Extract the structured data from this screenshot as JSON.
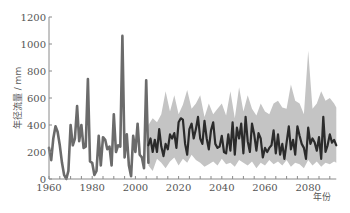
{
  "chart_data": {
    "type": "line",
    "title": "",
    "xlabel": "年份",
    "ylabel": "年径流量 / mm",
    "xlim": [
      1960,
      2093
    ],
    "ylim": [
      0,
      1200
    ],
    "x_ticks": [
      1960,
      1980,
      2000,
      2020,
      2040,
      2060,
      2080
    ],
    "y_ticks": [
      0,
      200,
      400,
      600,
      800,
      1000,
      1200
    ],
    "grid": false,
    "legend": null,
    "colors": {
      "observed": "#6b6b6b",
      "projected": "#2b2b2b",
      "band": "#c4c4c4",
      "axis": "#8a8a8a"
    },
    "series": [
      {
        "name": "observed",
        "x": [
          1960,
          1961,
          1962,
          1963,
          1964,
          1965,
          1966,
          1967,
          1968,
          1969,
          1970,
          1971,
          1972,
          1973,
          1974,
          1975,
          1976,
          1977,
          1978,
          1979,
          1980,
          1981,
          1982,
          1983,
          1984,
          1985,
          1986,
          1987,
          1988,
          1989,
          1990,
          1991,
          1992,
          1993,
          1994,
          1995,
          1996,
          1997,
          1998,
          1999,
          2000,
          2001,
          2002,
          2003,
          2004,
          2005,
          2006
        ],
        "values": [
          230,
          140,
          300,
          390,
          350,
          250,
          120,
          30,
          0,
          60,
          400,
          250,
          300,
          540,
          280,
          400,
          230,
          240,
          740,
          130,
          120,
          30,
          60,
          320,
          100,
          310,
          290,
          220,
          240,
          100,
          480,
          200,
          250,
          240,
          1060,
          160,
          330,
          100,
          20,
          320,
          200,
          410,
          180,
          160,
          80,
          730,
          120
        ]
      },
      {
        "name": "projected_mean",
        "x": [
          2006,
          2007,
          2008,
          2009,
          2010,
          2011,
          2012,
          2013,
          2014,
          2015,
          2016,
          2017,
          2018,
          2019,
          2020,
          2021,
          2022,
          2023,
          2024,
          2025,
          2026,
          2027,
          2028,
          2029,
          2030,
          2031,
          2032,
          2033,
          2034,
          2035,
          2036,
          2037,
          2038,
          2039,
          2040,
          2041,
          2042,
          2043,
          2044,
          2045,
          2046,
          2047,
          2048,
          2049,
          2050,
          2051,
          2052,
          2053,
          2054,
          2055,
          2056,
          2057,
          2058,
          2059,
          2060,
          2061,
          2062,
          2063,
          2064,
          2065,
          2066,
          2067,
          2068,
          2069,
          2070,
          2071,
          2072,
          2073,
          2074,
          2075,
          2076,
          2077,
          2078,
          2079,
          2080,
          2081,
          2082,
          2083,
          2084,
          2085,
          2086,
          2087,
          2088,
          2089,
          2090,
          2091,
          2092,
          2093
        ],
        "values": [
          250,
          300,
          200,
          290,
          200,
          370,
          240,
          170,
          260,
          220,
          330,
          300,
          340,
          230,
          420,
          450,
          440,
          260,
          180,
          370,
          410,
          300,
          370,
          460,
          300,
          260,
          430,
          300,
          220,
          360,
          420,
          260,
          230,
          240,
          320,
          200,
          190,
          330,
          210,
          420,
          180,
          380,
          300,
          410,
          190,
          460,
          280,
          200,
          410,
          330,
          210,
          340,
          300,
          160,
          230,
          200,
          230,
          250,
          360,
          190,
          330,
          180,
          260,
          150,
          270,
          390,
          220,
          290,
          180,
          390,
          320,
          260,
          230,
          150,
          380,
          260,
          300,
          270,
          210,
          310,
          150,
          460,
          200,
          250,
          330,
          270,
          290,
          250
        ]
      }
    ],
    "band": {
      "name": "projection_range",
      "x": [
        2006,
        2008,
        2010,
        2012,
        2014,
        2016,
        2018,
        2020,
        2022,
        2024,
        2026,
        2028,
        2030,
        2032,
        2034,
        2036,
        2038,
        2040,
        2042,
        2044,
        2046,
        2048,
        2050,
        2052,
        2054,
        2056,
        2058,
        2060,
        2062,
        2064,
        2066,
        2068,
        2070,
        2072,
        2074,
        2076,
        2078,
        2080,
        2082,
        2084,
        2086,
        2088,
        2090,
        2092,
        2093
      ],
      "upper": [
        400,
        450,
        420,
        480,
        650,
        500,
        620,
        480,
        550,
        660,
        520,
        560,
        620,
        460,
        560,
        480,
        520,
        560,
        470,
        650,
        450,
        680,
        500,
        620,
        520,
        470,
        560,
        500,
        480,
        560,
        580,
        530,
        520,
        700,
        580,
        560,
        480,
        950,
        520,
        560,
        650,
        580,
        600,
        560,
        530
      ],
      "lower": [
        100,
        60,
        150,
        120,
        80,
        130,
        160,
        100,
        150,
        120,
        180,
        140,
        120,
        90,
        110,
        130,
        100,
        150,
        110,
        120,
        90,
        140,
        120,
        100,
        130,
        80,
        120,
        100,
        140,
        110,
        130,
        100,
        140,
        90,
        120,
        110,
        80,
        140,
        100,
        130,
        90,
        120,
        110,
        130,
        120
      ]
    }
  }
}
